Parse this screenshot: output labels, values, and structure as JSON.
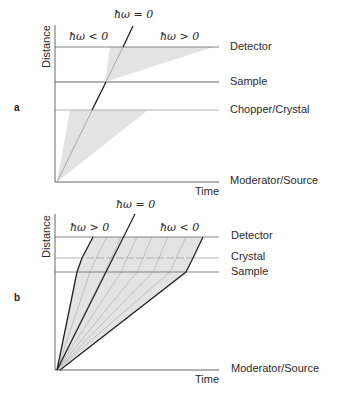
{
  "panel_a": {
    "label": "a",
    "y_axis_label": "Distance",
    "x_axis_label": "Time",
    "hw_zero": "ħω = 0",
    "hw_left": "ħω < 0",
    "hw_right": "ħω > 0",
    "levels": [
      {
        "name": "Detector"
      },
      {
        "name": "Sample"
      },
      {
        "name": "Chopper/Crystal"
      },
      {
        "name": "Moderator/Source"
      }
    ]
  },
  "panel_b": {
    "label": "b",
    "y_axis_label": "Distance",
    "x_axis_label": "Time",
    "hw_zero": "ħω = 0",
    "hw_left": "ħω > 0",
    "hw_right": "ħω < 0",
    "levels": [
      {
        "name": "Detector"
      },
      {
        "name": "Crystal"
      },
      {
        "name": "Sample"
      },
      {
        "name": "Moderator/Source"
      }
    ]
  },
  "colors": {
    "fill": "#e3e3e3",
    "line": "#222222",
    "grid": "#888888",
    "gray_ray": "#a8a8a8"
  }
}
